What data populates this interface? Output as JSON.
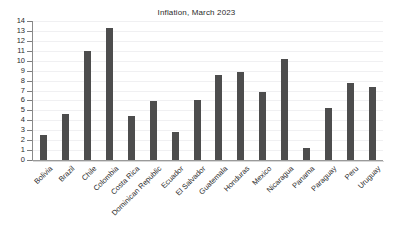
{
  "chart_data": {
    "type": "bar",
    "title": "Inflation, March 2023",
    "xlabel": "",
    "ylabel": "",
    "ylim": [
      0,
      14
    ],
    "yticks": [
      0,
      1,
      2,
      3,
      4,
      5,
      6,
      7,
      8,
      9,
      10,
      11,
      12,
      13,
      14
    ],
    "grid": true,
    "legend": "none",
    "bar_color": "#4d4d4d",
    "categories": [
      "Bolivia",
      "Brazil",
      "Chile",
      "Colombia",
      "Costa Rica",
      "Dominican Republic",
      "Ecuador",
      "El Salvador",
      "Guatemala",
      "Honduras",
      "Mexico",
      "Nicaragua",
      "Panama",
      "Paraguay",
      "Peru",
      "Uruguay"
    ],
    "values": [
      2.5,
      4.6,
      11.0,
      13.3,
      4.4,
      5.9,
      2.8,
      6.0,
      8.6,
      8.9,
      6.8,
      10.2,
      1.2,
      5.2,
      7.8,
      7.4
    ]
  }
}
